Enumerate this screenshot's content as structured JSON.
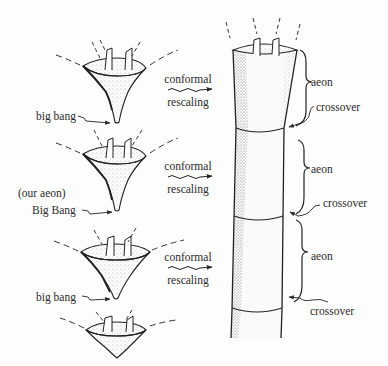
{
  "figure": {
    "left_column": {
      "cones": [
        {
          "id": "cone-1",
          "label": "big bang"
        },
        {
          "id": "cone-2",
          "label": "Big Bang",
          "note": "(our aeon)"
        },
        {
          "id": "cone-3",
          "label": "big bang"
        },
        {
          "id": "cone-4"
        }
      ]
    },
    "middle_column": {
      "transforms": [
        {
          "line1": "conformal",
          "line2": "rescaling"
        },
        {
          "line1": "conformal",
          "line2": "rescaling"
        },
        {
          "line1": "conformal",
          "line2": "rescaling"
        }
      ]
    },
    "right_column": {
      "labels": [
        {
          "kind": "aeon",
          "text": "aeon"
        },
        {
          "kind": "crossover",
          "text": "crossover"
        },
        {
          "kind": "aeon",
          "text": "aeon"
        },
        {
          "kind": "crossover",
          "text": "crossover"
        },
        {
          "kind": "aeon",
          "text": "aeon"
        },
        {
          "kind": "crossover",
          "text": "crossover"
        }
      ]
    },
    "colors": {
      "ink": "#2a2a2a",
      "paper": "#fdfdfd",
      "stipple": "#6a6a6a"
    }
  }
}
